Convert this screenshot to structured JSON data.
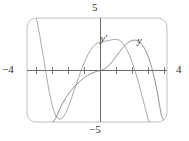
{
  "figure": {
    "name": "function-and-derivative-graph",
    "frame_color": "#b9b9b9",
    "axis_color": "#5a5a5a",
    "curve_color_y": "#7a7a7a",
    "curve_color_yprime": "#8a8a8a",
    "background": "#ffffff"
  },
  "labels": {
    "y_max": "5",
    "y_min": "−5",
    "x_min": "−4",
    "x_max": "4",
    "curve_y": "y",
    "curve_y_prime": "y′"
  },
  "chart_data": {
    "type": "line",
    "title": "",
    "xlabel": "",
    "ylabel": "",
    "xlim": [
      -4,
      4
    ],
    "ylim": [
      -5,
      5
    ],
    "grid": false,
    "legend_position": "inline-annotation",
    "axis_ticks": {
      "x": [
        -4,
        -3,
        -2,
        -1,
        0,
        1,
        2,
        3,
        4
      ],
      "y": [
        -5,
        5
      ],
      "x_labeled": [
        -4,
        4
      ],
      "y_labeled": [
        -5,
        5
      ]
    },
    "annotations": [
      {
        "text": "y′",
        "x": 0.25,
        "y": 3.05
      },
      {
        "text": "y",
        "x": 2.55,
        "y": 2.85
      }
    ],
    "series": [
      {
        "name": "y",
        "label": "y",
        "x": [
          -4.0,
          -3.8,
          -3.6,
          -3.4,
          -3.2,
          -3.0,
          -2.8,
          -2.6,
          -2.4,
          -2.2,
          -2.0,
          -1.8,
          -1.6,
          -1.4,
          -1.2,
          -1.0,
          -0.8,
          -0.6,
          -0.4,
          -0.2,
          0.0,
          0.2,
          0.4,
          0.6,
          0.8,
          1.0,
          1.2,
          1.4,
          1.6,
          1.8,
          2.0,
          2.2,
          2.4,
          2.6,
          2.8,
          3.0,
          3.2,
          3.4,
          3.6,
          3.8,
          4.0
        ],
        "y": [
          -5.0,
          -5.0,
          -5.0,
          -5.0,
          -5.0,
          -5.0,
          -4.6,
          -3.9,
          -3.25,
          -2.7,
          -2.25,
          -1.85,
          -1.5,
          -1.2,
          -0.92,
          -0.68,
          -0.47,
          -0.3,
          -0.17,
          -0.06,
          0.0,
          0.1,
          0.3,
          0.6,
          0.98,
          1.4,
          1.82,
          2.2,
          2.52,
          2.76,
          2.9,
          2.92,
          2.8,
          2.5,
          2.0,
          1.28,
          0.3,
          -0.95,
          -2.5,
          -4.3,
          -5.0
        ]
      },
      {
        "name": "y'",
        "label": "y′",
        "x": [
          -4.0,
          -3.8,
          -3.6,
          -3.4,
          -3.2,
          -3.0,
          -2.8,
          -2.6,
          -2.4,
          -2.2,
          -2.0,
          -1.8,
          -1.6,
          -1.4,
          -1.2,
          -1.0,
          -0.8,
          -0.6,
          -0.4,
          -0.2,
          0.0,
          0.2,
          0.4,
          0.6,
          0.8,
          1.0,
          1.2,
          1.4,
          1.6,
          1.8,
          2.0,
          2.2,
          2.4,
          2.6,
          2.8,
          3.0,
          3.2,
          3.4,
          3.6,
          3.8,
          4.0
        ],
        "y": [
          5.0,
          3.4,
          1.6,
          -0.3,
          -2.1,
          -3.5,
          -4.35,
          -4.7,
          -4.6,
          -4.15,
          -3.45,
          -2.6,
          -1.7,
          -0.8,
          0.05,
          0.82,
          1.48,
          2.0,
          2.4,
          2.64,
          2.75,
          2.8,
          2.85,
          2.92,
          2.98,
          3.0,
          2.9,
          2.62,
          2.15,
          1.5,
          0.7,
          -0.25,
          -1.3,
          -2.45,
          -3.65,
          -4.85,
          -5.0,
          -5.0,
          -5.0,
          -5.0,
          -5.0
        ]
      }
    ]
  }
}
